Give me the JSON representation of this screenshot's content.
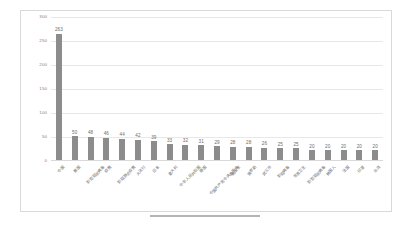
{
  "chart_data": {
    "type": "bar",
    "title": "",
    "xlabel": "",
    "ylabel": "",
    "ylim": [
      0,
      300
    ],
    "yticks": [
      0,
      50,
      100,
      150,
      200,
      250,
      300
    ],
    "ytick_labels": [
      "0",
      "50",
      "100",
      "150",
      "200",
      "250",
      "300"
    ],
    "grid": true,
    "legend": "none",
    "bar_color": "#8c8c8c",
    "gridline_color": "#e8e8e8",
    "categories": [
      "中国",
      "美国",
      "新型冠状病毒",
      "疫情",
      "新冠肺炎疫情",
      "大流行",
      "日本",
      "意大利",
      "中华人民共和国",
      "德国",
      "中国共产党中央委员会",
      "英国家",
      "俄罗斯",
      "武汉市",
      "新冠病毒",
      "世界卫生",
      "新型冠状病毒",
      "韩国人",
      "法国",
      "印度",
      "台湾"
    ],
    "values": [
      263,
      50,
      48,
      46,
      44,
      42,
      39,
      33,
      32,
      31,
      29,
      28,
      28,
      26,
      25,
      25,
      20,
      20,
      20,
      20,
      20
    ],
    "value_labels": [
      "263",
      "50",
      "48",
      "46",
      "44",
      "42",
      "39",
      "33",
      "32",
      "31",
      "29",
      "28",
      "28",
      "26",
      "25",
      "25",
      "20",
      "20",
      "20",
      "20",
      "20"
    ]
  }
}
